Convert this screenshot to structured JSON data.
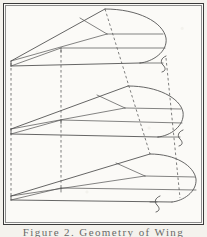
{
  "figure": {
    "title_caption": "Figure 2. Geometry of Wing",
    "caption_visible_fragment": "Figure 2. Geometry of Wing",
    "background_color": "#fbfaf7",
    "frame_color": "#3a3a3a",
    "line_color": "#4a4a4a",
    "dashed_line_color": "#5a5a5a",
    "projection": "isometric",
    "section_count": 3,
    "sections": [
      {
        "name": "upper-wing-planform",
        "apex_x": 105,
        "apex_y": 9,
        "root_x": 11,
        "root_y": 61
      },
      {
        "name": "middle-wing-planform",
        "apex_x": 128,
        "apex_y": 86,
        "root_x": 11,
        "root_y": 129
      },
      {
        "name": "lower-wing-planform",
        "apex_x": 150,
        "apex_y": 154,
        "root_x": 11,
        "root_y": 196
      }
    ],
    "dashed_guides": [
      {
        "name": "left-vertical-guide",
        "x": 11
      },
      {
        "name": "inner-vertical-guide",
        "x": 61
      },
      {
        "name": "apex-slanted-guide",
        "label": "leading-edge-projection"
      },
      {
        "name": "tip-slanted-guide",
        "label": "tip-projection"
      }
    ]
  }
}
